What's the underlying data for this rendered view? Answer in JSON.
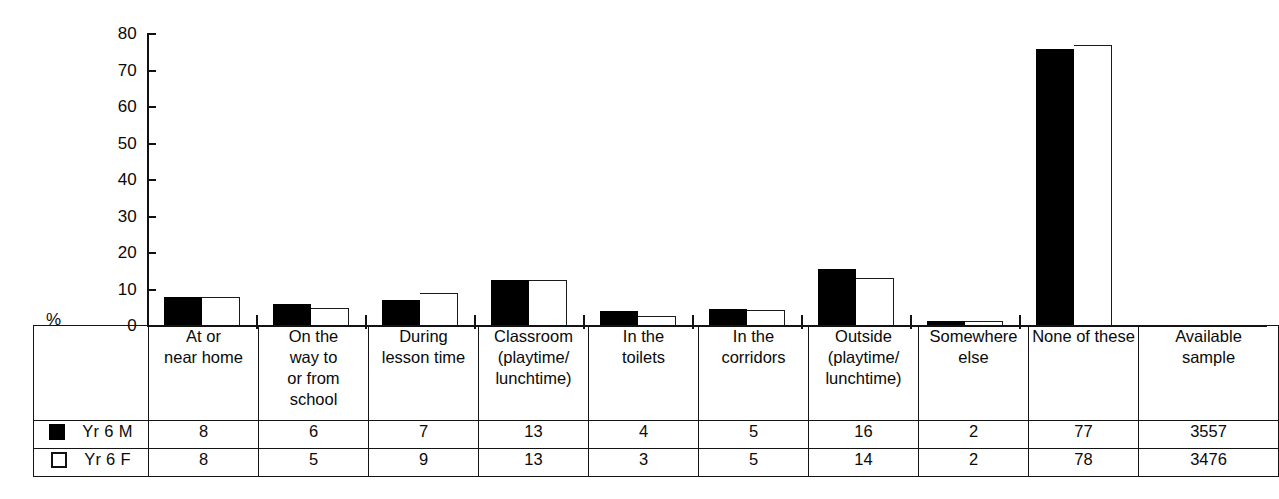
{
  "chart_data": {
    "type": "bar",
    "title": "",
    "xlabel": "",
    "ylabel": "%",
    "ylim": [
      0,
      80
    ],
    "yticks": [
      0,
      10,
      20,
      30,
      40,
      50,
      60,
      70,
      80
    ],
    "grid": false,
    "legend_position": "table-left",
    "categories": [
      "At or near home",
      "On the way to or from school",
      "During lesson time",
      "Classroom (playtime/ lunchtime)",
      "In the toilets",
      "In the corridors",
      "Outside (playtime/ lunchtime)",
      "Somewhere else",
      "None of these"
    ],
    "series": [
      {
        "name": "Yr 6 M",
        "color": "#000000",
        "values": [
          8,
          6,
          7,
          13,
          4,
          5,
          16,
          2,
          77
        ]
      },
      {
        "name": "Yr 6 F",
        "color": "#ffffff",
        "values": [
          8,
          5,
          9,
          13,
          3,
          5,
          14,
          2,
          78
        ]
      }
    ]
  },
  "axis": {
    "y_label": "%",
    "tick_labels": [
      "80",
      "70",
      "60",
      "50",
      "40",
      "30",
      "20",
      "10",
      "0"
    ]
  },
  "table": {
    "header_blank": "",
    "columns": [
      {
        "lines": [
          "At or",
          "near home"
        ]
      },
      {
        "lines": [
          "On the",
          "way to",
          "or from",
          "school"
        ]
      },
      {
        "lines": [
          "During",
          "lesson time"
        ]
      },
      {
        "lines": [
          "Classroom",
          "(playtime/",
          "lunchtime)"
        ]
      },
      {
        "lines": [
          "In the",
          "toilets"
        ]
      },
      {
        "lines": [
          "In the",
          "corridors"
        ]
      },
      {
        "lines": [
          "Outside",
          "(playtime/",
          "lunchtime)"
        ]
      },
      {
        "lines": [
          "Somewhere",
          "else"
        ]
      },
      {
        "lines": [
          "None of these"
        ]
      },
      {
        "lines": [
          "Available",
          "sample"
        ]
      }
    ],
    "rows": [
      {
        "label": "Yr 6 M",
        "swatch": "filled-square-icon",
        "values": [
          "8",
          "6",
          "7",
          "13",
          "4",
          "5",
          "16",
          "2",
          "77",
          "3557"
        ]
      },
      {
        "label": "Yr 6 F",
        "swatch": "hollow-square-icon",
        "values": [
          "8",
          "5",
          "9",
          "13",
          "3",
          "5",
          "14",
          "2",
          "78",
          "3476"
        ]
      }
    ]
  },
  "colors": {
    "series_m": "#000000",
    "series_f": "#ffffff",
    "line": "#111111",
    "background": "#ffffff"
  }
}
